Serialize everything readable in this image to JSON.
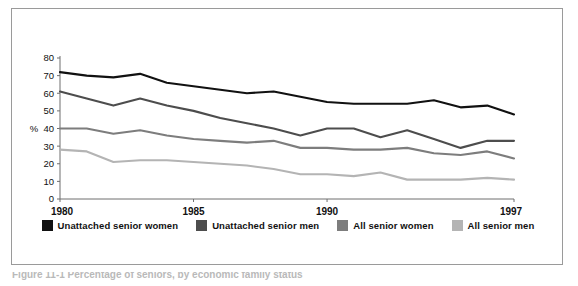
{
  "chart_data": {
    "type": "line",
    "title": "",
    "xlabel": "",
    "ylabel": "%",
    "x": [
      1980,
      1981,
      1982,
      1983,
      1984,
      1985,
      1986,
      1987,
      1988,
      1989,
      1990,
      1991,
      1992,
      1993,
      1994,
      1995,
      1996,
      1997
    ],
    "xlim": [
      1980,
      1997
    ],
    "ylim": [
      0,
      80
    ],
    "xticks": [
      "1980",
      "1985",
      "1990",
      "1997"
    ],
    "xtick_values": [
      1980,
      1985,
      1990,
      1997
    ],
    "yticks": [
      "0",
      "10",
      "20",
      "30",
      "40",
      "50",
      "60",
      "70",
      "80"
    ],
    "ytick_values": [
      0,
      10,
      20,
      30,
      40,
      50,
      60,
      70,
      80
    ],
    "grid": false,
    "legend_position": "bottom",
    "series": [
      {
        "name": "Unattached senior women",
        "color": "#111111",
        "values": [
          72,
          70,
          69,
          71,
          66,
          64,
          62,
          60,
          61,
          58,
          55,
          54,
          54,
          54,
          56,
          52,
          53,
          48
        ]
      },
      {
        "name": "Unattached senior men",
        "color": "#4d4d4d",
        "values": [
          61,
          57,
          53,
          57,
          53,
          50,
          46,
          43,
          40,
          36,
          40,
          40,
          35,
          39,
          34,
          29,
          33,
          33
        ]
      },
      {
        "name": "All senior women",
        "color": "#7d7d7d",
        "values": [
          40,
          40,
          37,
          39,
          36,
          34,
          33,
          32,
          33,
          29,
          29,
          28,
          28,
          29,
          26,
          25,
          27,
          23
        ]
      },
      {
        "name": "All senior men",
        "color": "#b4b4b4",
        "values": [
          28,
          27,
          21,
          22,
          22,
          21,
          20,
          19,
          17,
          14,
          14,
          13,
          15,
          11,
          11,
          11,
          12,
          11
        ]
      }
    ]
  },
  "axis": {
    "y_axis_title": "%"
  },
  "legend": {
    "items": [
      {
        "label": "Unattached senior women",
        "color": "#111111"
      },
      {
        "label": "Unattached senior men",
        "color": "#4d4d4d"
      },
      {
        "label": "All senior women",
        "color": "#7d7d7d"
      },
      {
        "label": "All senior men",
        "color": "#b4b4b4"
      }
    ]
  },
  "caption": {
    "text": "Figure 11-1  Percentage of seniors, by economic family status"
  }
}
